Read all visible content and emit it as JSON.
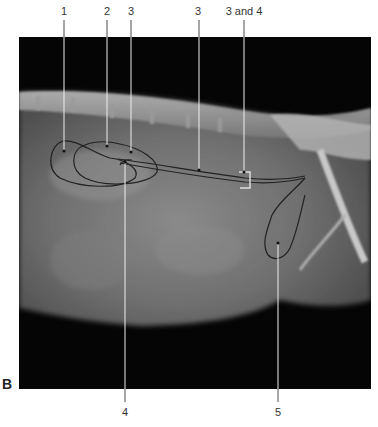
{
  "figure": {
    "panel_label": "B",
    "image_type": "lateral abdominal radiograph",
    "labels_top": [
      {
        "text": "1",
        "x": 64
      },
      {
        "text": "2",
        "x": 107
      },
      {
        "text": "3",
        "x": 131
      },
      {
        "text": "3",
        "x": 198
      },
      {
        "text": "3 and 4",
        "x": 244
      }
    ],
    "labels_bottom": [
      {
        "text": "4",
        "x": 125
      },
      {
        "text": "5",
        "x": 278
      }
    ]
  }
}
